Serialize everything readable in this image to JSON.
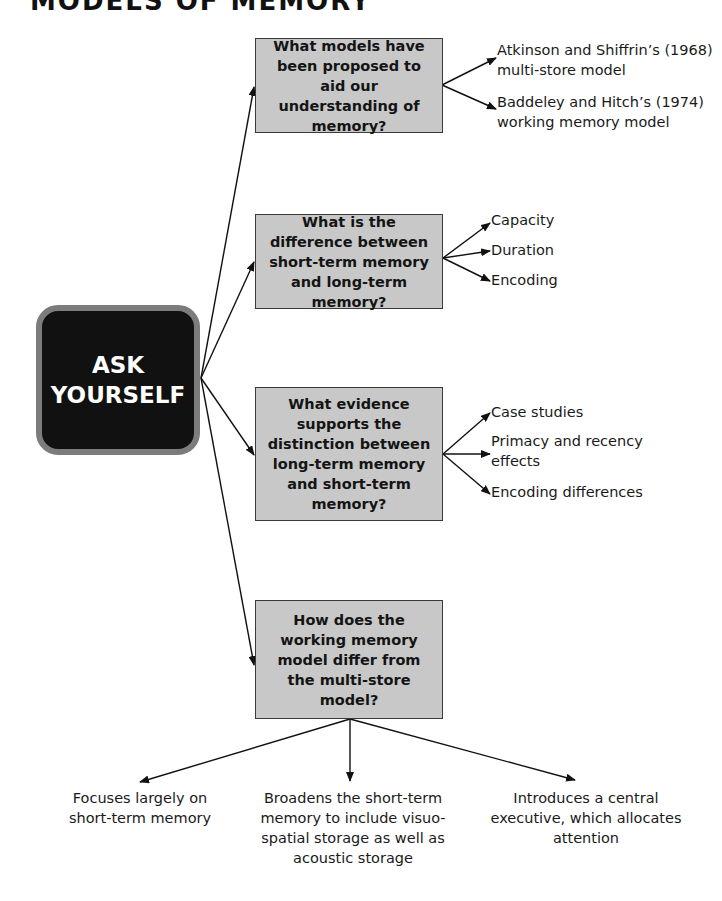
{
  "title": "MODELS OF MEMORY",
  "center": {
    "label": "ASK YOURSELF"
  },
  "questions": [
    {
      "text": "What models have been proposed to aid our understanding of memory?",
      "answers": [
        "Atkinson and Shiffrin’s (1968) multi-store model",
        "Baddeley and Hitch’s (1974) working memory model"
      ]
    },
    {
      "text": "What is the difference between short-term memory and long-term memory?",
      "answers": [
        "Capacity",
        "Duration",
        "Encoding"
      ]
    },
    {
      "text": "What evidence supports the distinction between long-term memory and short-term memory?",
      "answers": [
        "Case studies",
        "Primacy and recency effects",
        "Encoding differences"
      ]
    },
    {
      "text": "How does the working memory model differ from the multi-store model?",
      "answers": [
        "Focuses largely on short-term memory",
        "Broadens the short-term memory to include visuo-spatial storage as well as acoustic storage",
        "Introduces a central executive, which allocates attention"
      ]
    }
  ],
  "colors": {
    "question_box": "#c8c8c8",
    "center_box": "#111111",
    "center_border": "#7c7c7c"
  }
}
